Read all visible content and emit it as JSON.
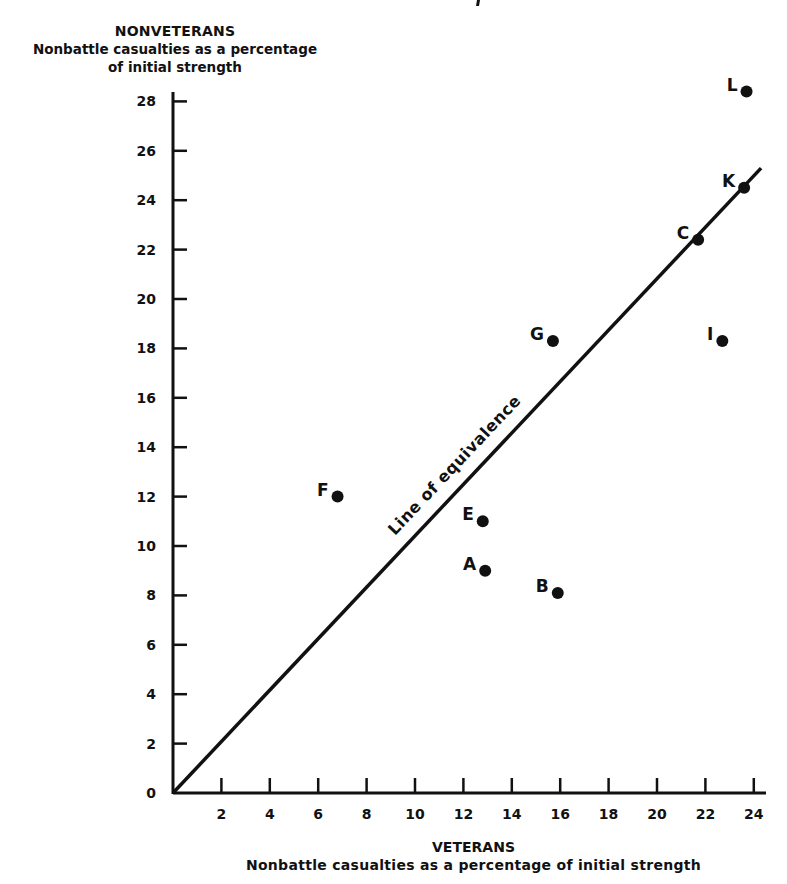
{
  "chart_data": {
    "type": "scatter",
    "title": "",
    "ylabel_head": "NONVETERANS",
    "ylabel_sub_line1": "Nonbattle casualties as a percentage",
    "ylabel_sub_line2": "of initial strength",
    "xlabel_head": "VETERANS",
    "xlabel_sub": "Nonbattle casualties as a percentage of initial strength",
    "xlim": [
      0,
      24.5
    ],
    "ylim": [
      0,
      29
    ],
    "x_ticks": [
      2,
      4,
      6,
      8,
      10,
      12,
      14,
      16,
      18,
      20,
      22,
      24
    ],
    "y_ticks": [
      0,
      2,
      4,
      6,
      8,
      10,
      12,
      14,
      16,
      18,
      20,
      22,
      24,
      26,
      28
    ],
    "grid": false,
    "legend": null,
    "reference_line": {
      "label": "Line of equivalence",
      "from": [
        0,
        0
      ],
      "to": [
        24.3,
        25.3
      ],
      "description": "y = x diagonal"
    },
    "points": [
      {
        "label": "L",
        "x": 23.7,
        "y": 28.4
      },
      {
        "label": "K",
        "x": 23.6,
        "y": 24.5
      },
      {
        "label": "C",
        "x": 21.7,
        "y": 22.4
      },
      {
        "label": "G",
        "x": 15.7,
        "y": 18.3
      },
      {
        "label": "I",
        "x": 22.7,
        "y": 18.3
      },
      {
        "label": "F",
        "x": 6.8,
        "y": 12.0
      },
      {
        "label": "E",
        "x": 12.8,
        "y": 11.0
      },
      {
        "label": "A",
        "x": 12.9,
        "y": 9.0
      },
      {
        "label": "B",
        "x": 15.9,
        "y": 8.1
      }
    ],
    "colors": {
      "ink": "#111111",
      "background": "#ffffff"
    }
  }
}
